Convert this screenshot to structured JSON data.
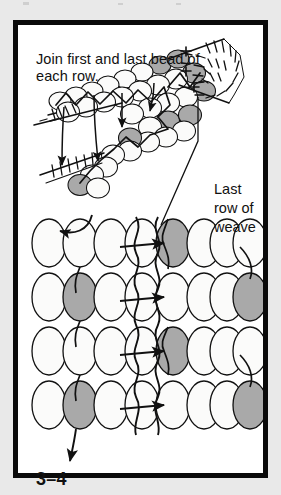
{
  "figure": {
    "number_label": "3–4",
    "caption": "Join first and last bead of each row.",
    "side_label_line1": "Last",
    "side_label_line2": "row of",
    "side_label_line3": "weave",
    "side_label_full": "Last row of weave"
  },
  "colors": {
    "page_background": "#e9e9e9",
    "frame_border": "#0a0a0a",
    "panel_background": "#ffffff",
    "bead_fill_light": "#fbfbfa",
    "bead_fill_gray": "#a9a9a9",
    "bead_outline": "#111111",
    "thread_dark": "#111111",
    "thread_light": "#d6d6d6",
    "text": "#111111"
  },
  "diagram": {
    "type": "beadwork-ladder-stitch-join",
    "rows": 4,
    "beads_per_group": 4,
    "groups_per_row": 2,
    "group_labels": [
      "left",
      "right"
    ],
    "shaded_beads": [
      {
        "row": 1,
        "group": "right",
        "index": 1
      },
      {
        "row": 2,
        "group": "left",
        "index": 2
      },
      {
        "row": 2,
        "group": "right",
        "index": 4
      },
      {
        "row": 3,
        "group": "right",
        "index": 1
      },
      {
        "row": 4,
        "group": "left",
        "index": 2
      },
      {
        "row": 4,
        "group": "right",
        "index": 4
      }
    ],
    "row_arrows": 4,
    "arrow_direction": "right",
    "vertical_threads": 2,
    "entry_arrow": "top-left curved arrow into row 1",
    "exit_arrow": "bottom-left arrow out of row 4"
  },
  "illustration": {
    "name": "three-dimensional-bead-strip",
    "description": "Perspective view of a woven bead strip with needle and thread joining the first and last bead of each row.",
    "bead_rows": 3,
    "shaded_bead_count": 7,
    "needle_arrows": 4,
    "hatch_clusters": 3
  }
}
